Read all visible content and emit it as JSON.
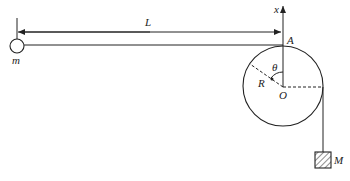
{
  "diagram": {
    "type": "physics-mechanics",
    "labels": {
      "length": "L",
      "small_mass": "m",
      "axis": "x",
      "point_top": "A",
      "angle": "θ",
      "radius": "R",
      "center": "O",
      "hanging_mass": "M"
    },
    "colors": {
      "stroke": "#222222",
      "background": "#ffffff"
    },
    "geometry": {
      "small_mass_center": [
        17,
        46
      ],
      "small_mass_radius": 7,
      "cylinder_center": [
        283,
        87
      ],
      "cylinder_radius": 40,
      "dimension_line_y": 32,
      "string_y": 45,
      "hanging_block": {
        "x": 315,
        "y": 152,
        "w": 16,
        "h": 16
      }
    }
  }
}
